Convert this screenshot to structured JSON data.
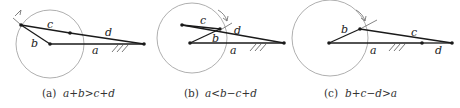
{
  "panels": [
    {
      "id": "a",
      "caption_prefix": "(a)",
      "caption_formula": "a+b>c+d",
      "labels": {
        "a": "a",
        "b": "b",
        "c": "c",
        "d": "d"
      }
    },
    {
      "id": "b",
      "caption_prefix": "(b)",
      "caption_formula": "a<b−c+d",
      "labels": {
        "a": "a",
        "b": "b",
        "c": "c",
        "d": "d"
      }
    },
    {
      "id": "c",
      "caption_prefix": "(c)",
      "caption_formula": "b+c−d>a",
      "labels": {
        "a": "a",
        "b": "b",
        "c": "c",
        "d": "d"
      }
    }
  ],
  "colors": {
    "line": "#1a1a1a",
    "circle": "#9a9a9a",
    "ground": "#6a6a6a"
  }
}
